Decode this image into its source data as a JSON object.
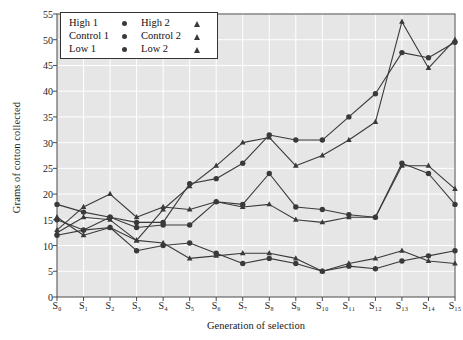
{
  "chart_data": {
    "type": "line",
    "title": "",
    "xlabel": "Generation of selection",
    "ylabel": "Grams of cotton collected",
    "categories": [
      "S0",
      "S1",
      "S2",
      "S3",
      "S4",
      "S5",
      "S6",
      "S7",
      "S8",
      "S9",
      "S10",
      "S11",
      "S12",
      "S13",
      "S14",
      "S15"
    ],
    "xtick_labels": [
      "S₀",
      "S₁",
      "S₂",
      "S₃",
      "S₄",
      "S₅",
      "S₆",
      "S₇",
      "S₈",
      "S₉",
      "S₁₀",
      "S₁₁",
      "S₁₂",
      "S₁₃",
      "S₁₄",
      "S₁₅"
    ],
    "ylim": [
      0,
      55
    ],
    "yticks": [
      0,
      5,
      10,
      15,
      20,
      25,
      30,
      35,
      40,
      45,
      50,
      55
    ],
    "ytick_labels": [
      "0",
      "5",
      "10",
      "15",
      "20",
      "25",
      "30",
      "35",
      "40",
      "45",
      "50",
      "55"
    ],
    "grid": true,
    "grid_color": "#ffffff",
    "plot_background": "#e6e6e6",
    "line_color": "#3a3a3a",
    "legend_position": "top-left",
    "series": [
      {
        "name": "High 1",
        "marker": "circle",
        "values": [
          15.0,
          13.0,
          15.5,
          14.5,
          14.5,
          22.0,
          23.0,
          26.0,
          31.5,
          30.5,
          30.5,
          35.0,
          39.5,
          47.5,
          46.5,
          49.5
        ]
      },
      {
        "name": "High 2",
        "marker": "triangle",
        "values": [
          12.5,
          15.5,
          15.0,
          11.0,
          17.0,
          21.5,
          25.5,
          30.0,
          31.0,
          25.5,
          27.5,
          30.5,
          34.0,
          53.5,
          44.5,
          50.0
        ]
      },
      {
        "name": "Control 1",
        "marker": "circle",
        "values": [
          18.0,
          16.5,
          15.5,
          13.5,
          14.0,
          14.0,
          18.5,
          18.0,
          24.0,
          17.5,
          17.0,
          16.0,
          15.5,
          26.0,
          24.0,
          18.0
        ]
      },
      {
        "name": "Control 2",
        "marker": "triangle",
        "values": [
          13.0,
          17.5,
          20.0,
          15.5,
          17.5,
          17.0,
          18.5,
          17.5,
          18.0,
          15.0,
          14.5,
          15.5,
          15.5,
          25.5,
          25.5,
          21.0
        ]
      },
      {
        "name": "Low 1",
        "marker": "circle",
        "values": [
          12.0,
          13.0,
          13.5,
          9.0,
          10.0,
          10.5,
          8.5,
          6.5,
          7.5,
          6.5,
          5.0,
          6.0,
          5.5,
          7.0,
          8.0,
          9.0
        ]
      },
      {
        "name": "Low 2",
        "marker": "triangle",
        "values": [
          15.5,
          12.0,
          13.5,
          11.0,
          10.5,
          7.5,
          8.0,
          8.5,
          8.5,
          7.5,
          5.0,
          6.5,
          7.5,
          9.0,
          7.0,
          6.5
        ]
      }
    ]
  },
  "legend": {
    "entries": [
      {
        "label": "High 1",
        "marker": "circle"
      },
      {
        "label": "High 2",
        "marker": "triangle"
      },
      {
        "label": "Control 1",
        "marker": "circle"
      },
      {
        "label": "Control 2",
        "marker": "triangle"
      },
      {
        "label": "Low 1",
        "marker": "circle"
      },
      {
        "label": "Low 2",
        "marker": "triangle"
      }
    ]
  }
}
